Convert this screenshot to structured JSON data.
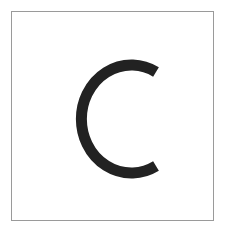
{
  "card": {
    "letter": "C",
    "letter_color": "#222222",
    "border_color": "#9a9a9a"
  }
}
